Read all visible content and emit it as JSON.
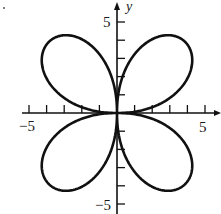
{
  "chart_data": {
    "type": "line",
    "subtype": "polar-curve",
    "title": "",
    "equation_hint": "r = a·sin(2θ)",
    "xlabel": "",
    "ylabel": "y",
    "xlim": [
      -5,
      5
    ],
    "ylim": [
      -5,
      5
    ],
    "x_tick_labels": [
      {
        "value": -5,
        "label": "−5"
      },
      {
        "value": 5,
        "label": "5"
      }
    ],
    "y_tick_labels": [
      {
        "value": 5,
        "label": "5"
      },
      {
        "value": -5,
        "label": "−5"
      }
    ],
    "x_ticks": [
      -5,
      -4,
      -3,
      -2,
      -1,
      1,
      2,
      3,
      4,
      5
    ],
    "y_ticks": [
      -5,
      -4,
      -3,
      -2,
      -1,
      1,
      2,
      3,
      4,
      5
    ],
    "grid": false,
    "legend": null,
    "series": [
      {
        "name": "rose curve",
        "amplitude": 5.5,
        "petals": 4,
        "petal_tips_approx": [
          [
            3.9,
            3.9
          ],
          [
            -3.9,
            3.9
          ],
          [
            -3.9,
            -3.9
          ],
          [
            3.9,
            -3.9
          ]
        ],
        "color": "#111111"
      }
    ]
  },
  "axes": {
    "y_label": "y",
    "x_min_label": "−5",
    "x_max_label": "5",
    "y_max_label": "5",
    "y_min_label": "−5"
  }
}
